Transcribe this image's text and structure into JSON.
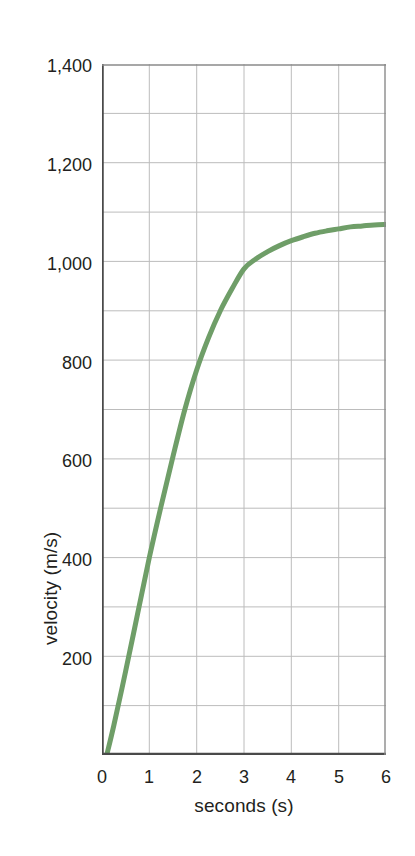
{
  "chart_data": {
    "type": "line",
    "title": "",
    "xlabel": "seconds (s)",
    "ylabel": "velocity (m/s)",
    "xlim": [
      0,
      6
    ],
    "ylim": [
      0,
      1400
    ],
    "grid": true,
    "legend": false,
    "legend_position": "none",
    "line_color": "#6f9e68",
    "line_width_px": 5,
    "x_ticks": [
      0,
      1,
      2,
      3,
      4,
      5,
      6
    ],
    "x_tick_labels": [
      "0",
      "1",
      "2",
      "3",
      "4",
      "5",
      "6"
    ],
    "y_ticks": [
      200,
      400,
      600,
      800,
      1000,
      1200,
      1400
    ],
    "y_tick_labels": [
      "200",
      "400",
      "600",
      "800",
      "1,000",
      "1,200",
      "1,400"
    ],
    "y_minor_gridline_step": 100,
    "x_minor_gridline_step": 1,
    "series": [
      {
        "name": "velocity",
        "x": [
          0.1,
          0.25,
          0.5,
          0.75,
          1.0,
          1.25,
          1.5,
          1.75,
          2.0,
          2.25,
          2.5,
          2.75,
          3.0,
          3.25,
          3.5,
          3.75,
          4.0,
          4.25,
          4.5,
          4.75,
          5.0,
          5.25,
          5.5,
          5.75,
          6.0
        ],
        "y": [
          0,
          60,
          170,
          285,
          400,
          505,
          605,
          700,
          780,
          845,
          900,
          945,
          985,
          1005,
          1020,
          1032,
          1042,
          1050,
          1057,
          1062,
          1066,
          1070,
          1072,
          1074,
          1075
        ]
      }
    ],
    "annotations": []
  },
  "axes": {
    "frame_color": "#555555",
    "grid_color": "#b9b9b9",
    "background": "#ffffff"
  }
}
